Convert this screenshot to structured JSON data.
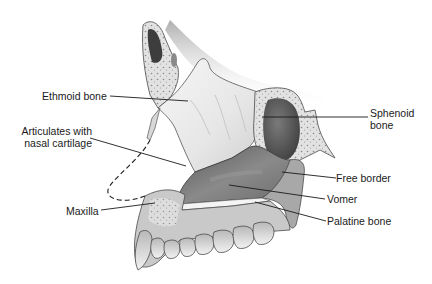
{
  "figure": {
    "labels": [
      {
        "id": "ethmoid",
        "text": "Ethmoid bone"
      },
      {
        "id": "articulates",
        "line1": "Articulates with",
        "line2": "nasal cartilage"
      },
      {
        "id": "maxilla",
        "text": "Maxilla"
      },
      {
        "id": "sphenoid",
        "line1": "Sphenoid",
        "line2": "bone"
      },
      {
        "id": "free_border",
        "text": "Free border"
      },
      {
        "id": "vomer",
        "text": "Vomer"
      },
      {
        "id": "palatine",
        "text": "Palatine bone"
      }
    ]
  },
  "colors": {
    "background": "#ffffff",
    "leader_line": "#1a1a1a",
    "bone_light": "#eeeeee",
    "bone_mid": "#bdbdbd",
    "bone_dark": "#6e6e6e",
    "sinus_dark": "#4a4a4a"
  }
}
